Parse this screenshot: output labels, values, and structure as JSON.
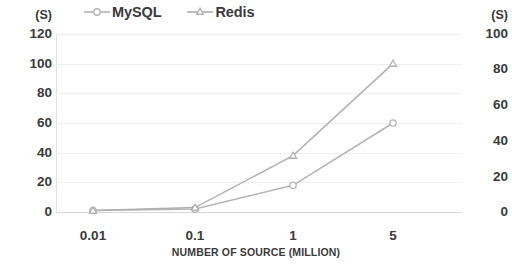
{
  "chart_data": {
    "type": "line",
    "title": "",
    "xlabel": "NUMBER OF SOURCE (MILLION)",
    "ylabel": "(S)",
    "y2label": "(S)",
    "categories": [
      "0.01",
      "0.1",
      "1",
      "5"
    ],
    "series": [
      {
        "name": "MySQL",
        "marker": "circle",
        "color": "#b3b3b3",
        "values": [
          1,
          2,
          18,
          60
        ]
      },
      {
        "name": "Redis",
        "marker": "triangle",
        "color": "#b0b0b0",
        "values": [
          1,
          3,
          38,
          100
        ]
      }
    ],
    "ylim": [
      0,
      120
    ],
    "yticks": [
      "120",
      "100",
      "80",
      "60",
      "40",
      "20",
      "0"
    ],
    "y2lim": [
      0,
      100
    ],
    "y2ticks": [
      "100",
      "80",
      "60",
      "40",
      "20",
      "0"
    ],
    "grid": true,
    "legend_position": "top",
    "axis_unit_left": "(S)",
    "axis_unit_right": "(S)"
  },
  "legend": {
    "entries": [
      {
        "label": "MySQL"
      },
      {
        "label": "Redis"
      }
    ]
  }
}
